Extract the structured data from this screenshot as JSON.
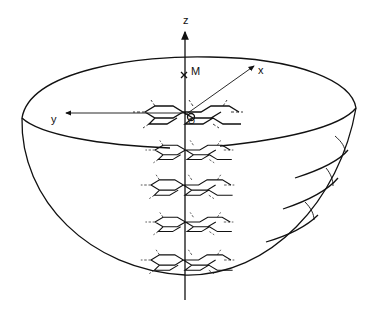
{
  "diagram": {
    "axes": {
      "z_label": "z",
      "x_label": "x",
      "y_label": "y",
      "origin_label": "O",
      "point_label": "M"
    },
    "layers": {
      "count": 5,
      "type": "hexagonal ring sheet"
    },
    "colors": {
      "line": "#111111",
      "background": "#ffffff"
    }
  }
}
